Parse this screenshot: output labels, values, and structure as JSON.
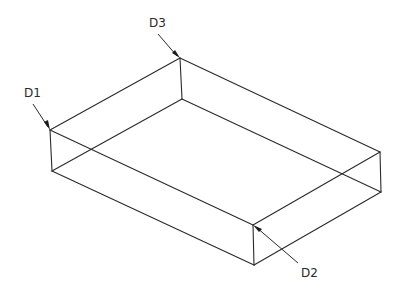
{
  "diagram": {
    "type": "isometric-wireframe-box",
    "stroke_color": "#2a2a2a",
    "background": "#ffffff",
    "vertices": {
      "top_back_left": [
        180,
        58
      ],
      "top_front_left": [
        50,
        130
      ],
      "top_back_right": [
        380,
        152
      ],
      "top_front_right": [
        253,
        225
      ],
      "bot_back_left": [
        182,
        99
      ],
      "bot_front_left": [
        52,
        171
      ],
      "bot_back_right": [
        381,
        192
      ],
      "bot_front_right": [
        254,
        265
      ]
    },
    "labels": [
      {
        "id": "D1",
        "text": "D1",
        "position": [
          24,
          97
        ],
        "points_to": "top_front_left"
      },
      {
        "id": "D2",
        "text": "D2",
        "position": [
          301,
          277
        ],
        "points_to": "top_front_right"
      },
      {
        "id": "D3",
        "text": "D3",
        "position": [
          149,
          27
        ],
        "points_to": "top_back_left"
      }
    ]
  }
}
